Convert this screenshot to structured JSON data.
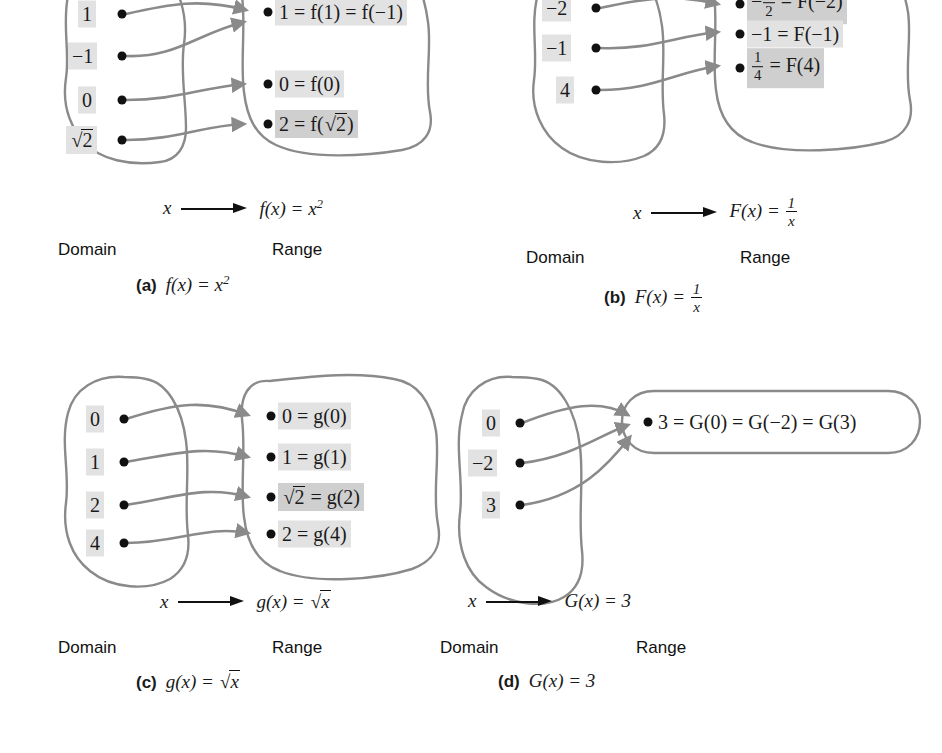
{
  "figure": {
    "title": "Function mapping diagrams",
    "panels": [
      {
        "id": "a",
        "tag": "(a)",
        "caption_fn": "f(x) = x²",
        "map_var": "x",
        "map_expr": "f(x) = x²",
        "domain_label": "Domain",
        "range_label": "Range",
        "domain_items": [
          "1",
          "√2 → see raw",
          "-1",
          "0"
        ],
        "domain_values": [
          "1",
          "−1",
          "0",
          "√2"
        ],
        "range_values": [
          "1 = f(1) = f(−1)",
          "0 = f(0)",
          "2 = f(√2)"
        ],
        "mappings": [
          {
            "from": "1",
            "to": "1 = f(1) = f(−1)"
          },
          {
            "from": "−1",
            "to": "1 = f(1) = f(−1)"
          },
          {
            "from": "0",
            "to": "0 = f(0)"
          },
          {
            "from": "√2",
            "to": "2 = f(√2)"
          }
        ]
      },
      {
        "id": "b",
        "tag": "(b)",
        "caption_fn": "F(x) = 1/x",
        "map_var": "x",
        "map_expr": "F(x) = 1/x",
        "domain_label": "Domain",
        "range_label": "Range",
        "domain_values": [
          "−2",
          "−1",
          "4"
        ],
        "range_values": [
          "−½ = F(−2)",
          "−1 = F(−1)",
          "¼ = F(4)"
        ],
        "mappings": [
          {
            "from": "−2",
            "to": "−½ = F(−2)"
          },
          {
            "from": "−1",
            "to": "−1 = F(−1)"
          },
          {
            "from": "4",
            "to": "¼ = F(4)"
          }
        ]
      },
      {
        "id": "c",
        "tag": "(c)",
        "caption_fn": "g(x) = √x",
        "map_var": "x",
        "map_expr": "g(x) = √x",
        "domain_label": "Domain",
        "range_label": "Range",
        "domain_values": [
          "0",
          "1",
          "2",
          "4"
        ],
        "range_values": [
          "0 = g(0)",
          "1 = g(1)",
          "√2 = g(2)",
          "2 = g(4)"
        ],
        "mappings": [
          {
            "from": "0",
            "to": "0 = g(0)"
          },
          {
            "from": "1",
            "to": "1 = g(1)"
          },
          {
            "from": "2",
            "to": "√2 = g(2)"
          },
          {
            "from": "4",
            "to": "2 = g(4)"
          }
        ]
      },
      {
        "id": "d",
        "tag": "(d)",
        "caption_fn": "G(x) = 3",
        "map_var": "x",
        "map_expr": "G(x) = 3",
        "domain_label": "Domain",
        "range_label": "Range",
        "domain_values": [
          "0",
          "−2",
          "3"
        ],
        "range_values": [
          "3 = G(0) = G(−2) = G(3)"
        ],
        "mappings": [
          {
            "from": "0",
            "to": "3 = G(0) = G(−2) = G(3)"
          },
          {
            "from": "−2",
            "to": "3 = G(0) = G(−2) = G(3)"
          },
          {
            "from": "3",
            "to": "3 = G(0) = G(−2) = G(3)"
          }
        ]
      }
    ],
    "colors": {
      "blob_stroke": "#8a8a8a",
      "arrow_curve": "#8a8a8a",
      "dot": "#111111",
      "highlight": "#e2e2e2",
      "text": "#1a1a1a",
      "background": "#ffffff"
    }
  },
  "panel_a": {
    "tag": "(a)",
    "domain_label": "Domain",
    "range_label": "Range",
    "map_var": "x",
    "dom": {
      "v0": "1",
      "v1": "−1",
      "v2": "0",
      "v3_pre": "",
      "v3": "2"
    },
    "rng": {
      "r0": "1 = f(1) = f(−1)",
      "r1": "0 = f(0)",
      "r2_pre": "2 = f(",
      "r2_rad": "2",
      "r2_post": ")"
    }
  },
  "panel_b": {
    "tag": "(b)",
    "domain_label": "Domain",
    "range_label": "Range",
    "map_var": "x",
    "dom": {
      "v0": "−2",
      "v1": "−1",
      "v2": "4"
    },
    "rng": {
      "r0_sign": "−",
      "r0_num": "1",
      "r0_den": "2",
      "r0_post": "= F(−2)",
      "r1": "−1 = F(−1)",
      "r2_num": "1",
      "r2_den": "4",
      "r2_post": "= F(4)"
    }
  },
  "panel_c": {
    "tag": "(c)",
    "domain_label": "Domain",
    "range_label": "Range",
    "map_var": "x",
    "dom": {
      "v0": "0",
      "v1": "1",
      "v2": "2",
      "v3": "4"
    },
    "rng": {
      "r0": "0 = g(0)",
      "r1": "1 = g(1)",
      "r2_rad": "2",
      "r2_post": " = g(2)",
      "r3": "2 = g(4)"
    }
  },
  "panel_d": {
    "tag": "(d)",
    "domain_label": "Domain",
    "range_label": "Range",
    "map_var": "x",
    "dom": {
      "v0": "0",
      "v1": "−2",
      "v2": "3"
    },
    "rng": {
      "r0": "3 = G(0) = G(−2) = G(3)"
    },
    "map_expr_pre": "G(x) = 3"
  }
}
